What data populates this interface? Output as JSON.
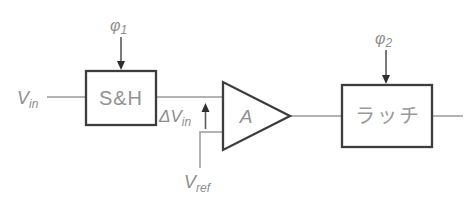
{
  "figure": {
    "type": "circuit-block-diagram",
    "colors": {
      "background": "#ffffff",
      "wire": "#9a9a9a",
      "box_border": "#3d3d3d",
      "arrow": "#2f2f2f",
      "label_text": "#8d8d8d"
    },
    "blocks": {
      "sample_hold": {
        "label": "S&H"
      },
      "amplifier": {
        "label": "A"
      },
      "latch": {
        "label": "ラッチ"
      }
    },
    "signals": {
      "input": {
        "base": "V",
        "sub": "in"
      },
      "clock1": {
        "base": "φ",
        "sub": "1"
      },
      "clock2": {
        "base": "φ",
        "sub": "2"
      },
      "delta_input": {
        "base": "ΔV",
        "sub": "in"
      },
      "reference": {
        "base": "V",
        "sub": "ref"
      }
    }
  }
}
